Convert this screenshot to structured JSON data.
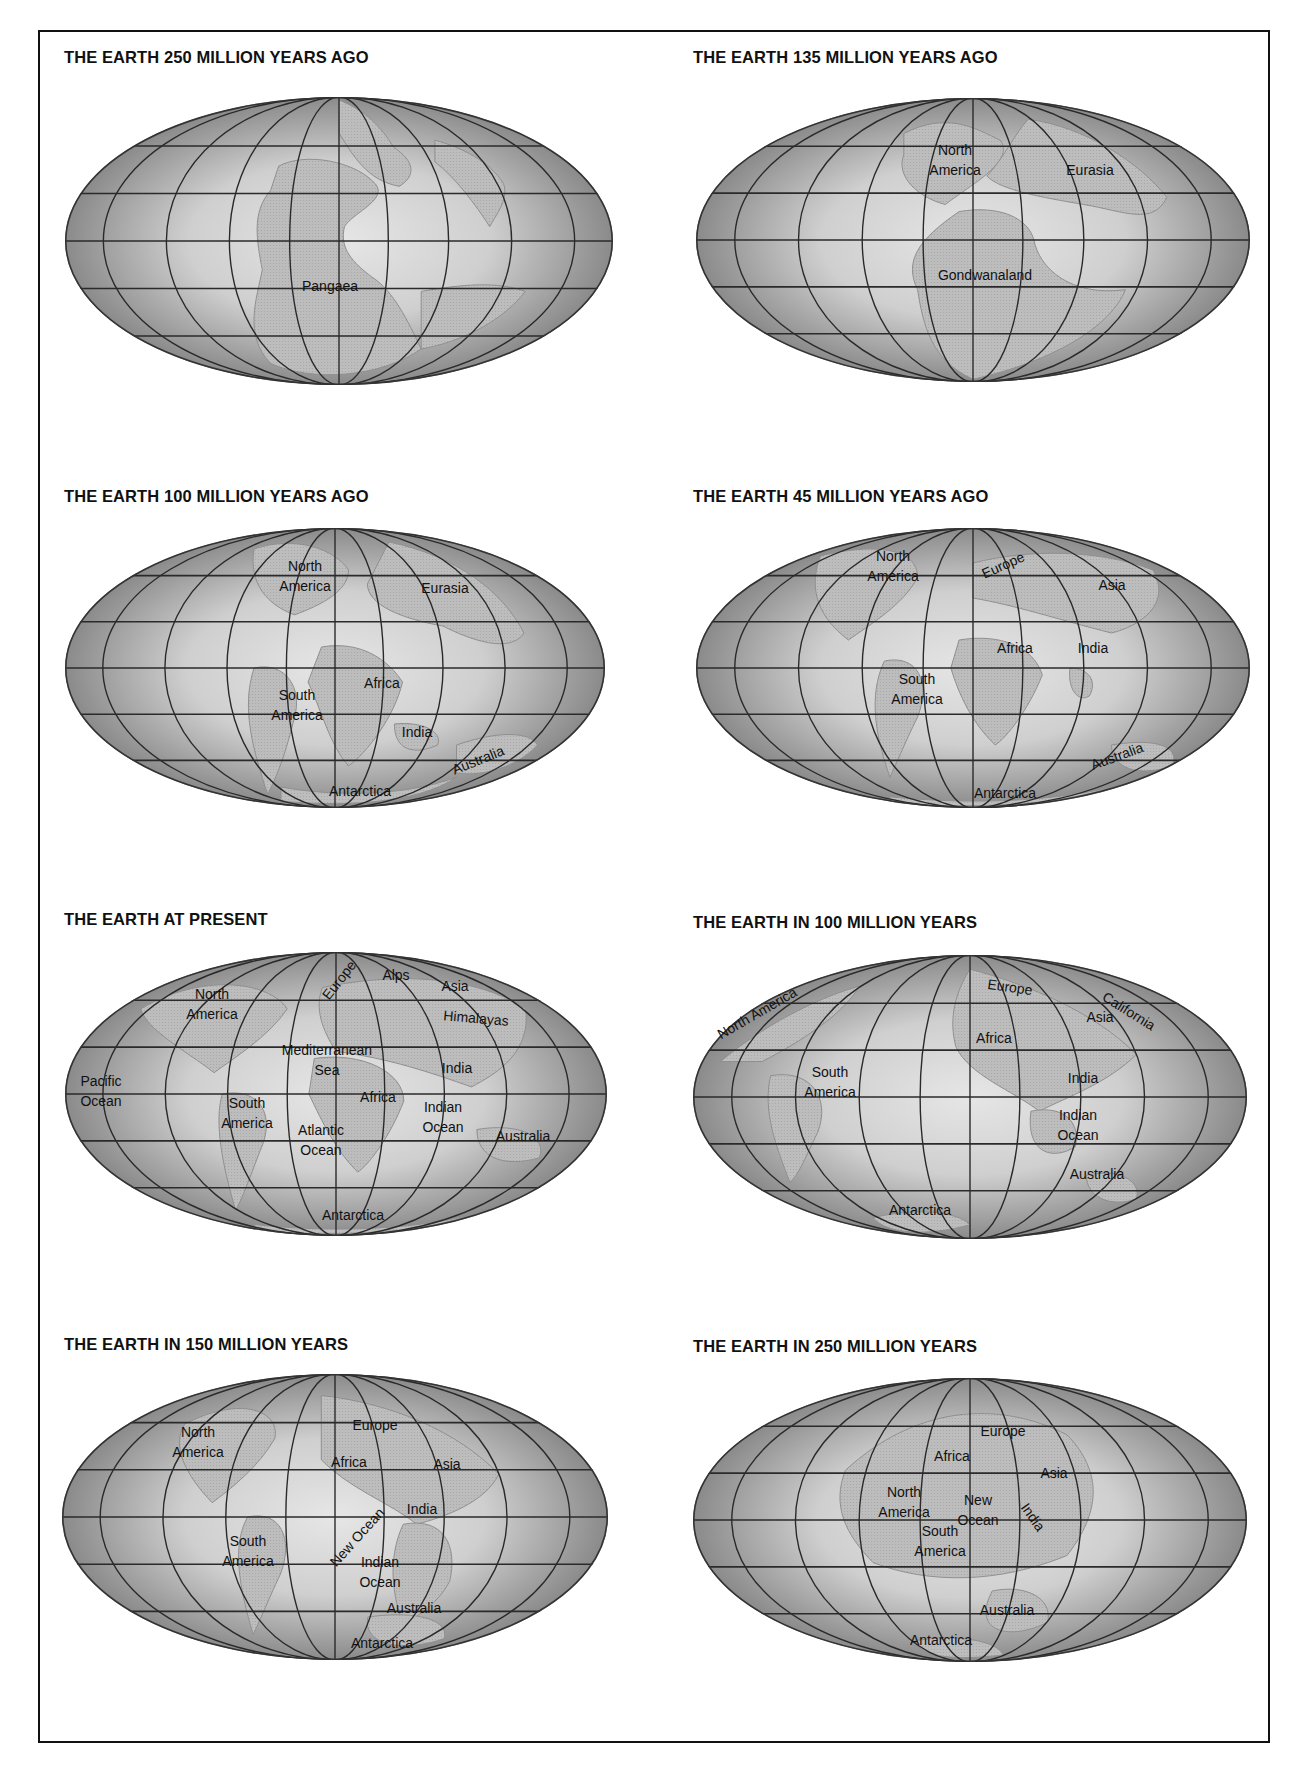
{
  "panels": [
    {
      "title": "THE EARTH 250 MILLION YEARS AGO",
      "labels": [
        "Pangaea"
      ]
    },
    {
      "title": "THE EARTH 135 MILLION YEARS AGO",
      "labels": [
        "North\nAmerica",
        "Eurasia",
        "Gondwanaland"
      ]
    },
    {
      "title": "THE EARTH 100 MILLION YEARS AGO",
      "labels": [
        "North\nAmerica",
        "Eurasia",
        "Africa",
        "South\nAmerica",
        "India",
        "Australia",
        "Antarctica"
      ]
    },
    {
      "title": "THE EARTH 45 MILLION YEARS AGO",
      "labels": [
        "North\nAmerica",
        "Europe",
        "Asia",
        "Africa",
        "India",
        "South\nAmerica",
        "Australia",
        "Antarctica"
      ]
    },
    {
      "title": "THE EARTH AT PRESENT",
      "labels": [
        "North\nAmerica",
        "Europe",
        "Alps",
        "Asia",
        "Himalayas",
        "Mediterranean\nSea",
        "India",
        "Pacific\nOcean",
        "South\nAmerica",
        "Africa",
        "Indian\nOcean",
        "Atlantic\nOcean",
        "Australia",
        "Antarctica"
      ]
    },
    {
      "title": "THE EARTH IN 100 MILLION YEARS",
      "labels": [
        "North America",
        "Europe",
        "California",
        "Asia",
        "Africa",
        "South\nAmerica",
        "India",
        "Indian\nOcean",
        "Australia",
        "Antarctica"
      ]
    },
    {
      "title": "THE EARTH IN 150 MILLION YEARS",
      "labels": [
        "North\nAmerica",
        "Europe",
        "Africa",
        "Asia",
        "India",
        "New Ocean",
        "South\nAmerica",
        "Indian\nOcean",
        "Australia",
        "Antarctica"
      ]
    },
    {
      "title": "THE EARTH IN 250 MILLION YEARS",
      "labels": [
        "Europe",
        "Africa",
        "Asia",
        "North\nAmerica",
        "New\nOcean",
        "India",
        "South\nAmerica",
        "Australia",
        "Antarctica"
      ]
    }
  ],
  "colors": {
    "frame": "#111111",
    "ocean_center": "#e6e6e6",
    "ocean_edge": "#8a8a8a",
    "land": "#bdbdbd",
    "grid": "#2a2a2a"
  }
}
